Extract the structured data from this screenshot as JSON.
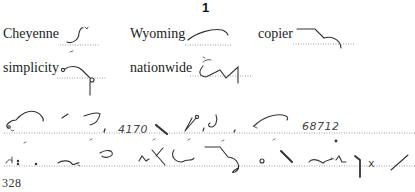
{
  "section": {
    "number": "1"
  },
  "vocabulary": [
    {
      "word": "Cheyenne"
    },
    {
      "word": "Wyoming"
    },
    {
      "word": "copier"
    },
    {
      "word": "simplicity"
    },
    {
      "word": "nationwide"
    }
  ],
  "passage": {
    "numbers": [
      "4170",
      "68712"
    ],
    "marks": [
      "x"
    ]
  },
  "footer": {
    "page_number": "328"
  }
}
